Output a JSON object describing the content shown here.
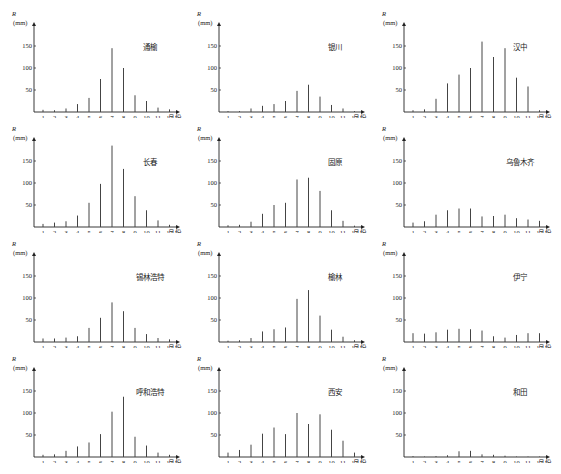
{
  "figure": {
    "y_symbol": "R",
    "y_unit": "(mm)",
    "x_unit": "月份"
  },
  "chart_data": [
    {
      "type": "bar",
      "title": "通榆",
      "xlabel": "月份",
      "ylabel": "R (mm)",
      "ylim": [
        0,
        180
      ],
      "yticks": [
        50,
        100,
        150
      ],
      "categories": [
        "1",
        "2",
        "3",
        "4",
        "5",
        "6",
        "7",
        "8",
        "9",
        "10",
        "11",
        "12"
      ],
      "values": [
        5,
        4,
        8,
        18,
        32,
        75,
        145,
        100,
        38,
        25,
        10,
        6
      ]
    },
    {
      "type": "bar",
      "title": "银川",
      "xlabel": "月份",
      "ylabel": "R (mm)",
      "ylim": [
        0,
        180
      ],
      "yticks": [
        50,
        100,
        150
      ],
      "categories": [
        "1",
        "2",
        "3",
        "4",
        "5",
        "6",
        "7",
        "8",
        "9",
        "10",
        "11",
        "12"
      ],
      "values": [
        2,
        2,
        8,
        14,
        18,
        25,
        48,
        62,
        35,
        16,
        8,
        2
      ]
    },
    {
      "type": "bar",
      "title": "汉中",
      "xlabel": "月份",
      "ylabel": "R (mm)",
      "ylim": [
        0,
        180
      ],
      "yticks": [
        50,
        100,
        150
      ],
      "categories": [
        "1",
        "2",
        "3",
        "4",
        "5",
        "6",
        "7",
        "8",
        "9",
        "10",
        "11",
        "12"
      ],
      "values": [
        4,
        6,
        30,
        65,
        85,
        100,
        160,
        125,
        145,
        78,
        58,
        4
      ]
    },
    {
      "type": "bar",
      "title": "长春",
      "xlabel": "月份",
      "ylabel": "R (mm)",
      "ylim": [
        0,
        180
      ],
      "yticks": [
        50,
        100,
        150
      ],
      "categories": [
        "1",
        "2",
        "3",
        "4",
        "5",
        "6",
        "7",
        "8",
        "9",
        "10",
        "11",
        "12"
      ],
      "values": [
        7,
        10,
        13,
        26,
        55,
        98,
        185,
        132,
        70,
        38,
        15,
        5
      ]
    },
    {
      "type": "bar",
      "title": "固原",
      "xlabel": "月份",
      "ylabel": "R (mm)",
      "ylim": [
        0,
        180
      ],
      "yticks": [
        50,
        100,
        150
      ],
      "categories": [
        "1",
        "2",
        "3",
        "4",
        "5",
        "6",
        "7",
        "8",
        "9",
        "10",
        "11",
        "12"
      ],
      "values": [
        4,
        5,
        12,
        30,
        50,
        55,
        108,
        112,
        82,
        38,
        14,
        3
      ]
    },
    {
      "type": "bar",
      "title": "乌鲁木齐",
      "xlabel": "月份",
      "ylabel": "R (mm)",
      "ylim": [
        0,
        180
      ],
      "yticks": [
        50,
        100,
        150
      ],
      "categories": [
        "1",
        "2",
        "3",
        "4",
        "5",
        "6",
        "7",
        "8",
        "9",
        "10",
        "11",
        "12"
      ],
      "values": [
        10,
        13,
        28,
        38,
        42,
        42,
        24,
        25,
        28,
        20,
        17,
        14
      ]
    },
    {
      "type": "bar",
      "title": "锡林浩特",
      "xlabel": "月份",
      "ylabel": "R (mm)",
      "ylim": [
        0,
        180
      ],
      "yticks": [
        50,
        100,
        150
      ],
      "categories": [
        "1",
        "2",
        "3",
        "4",
        "5",
        "6",
        "7",
        "8",
        "9",
        "10",
        "11",
        "12"
      ],
      "values": [
        8,
        8,
        10,
        13,
        32,
        55,
        90,
        70,
        32,
        18,
        9,
        6
      ]
    },
    {
      "type": "bar",
      "title": "榆林",
      "xlabel": "月份",
      "ylabel": "R (mm)",
      "ylim": [
        0,
        180
      ],
      "yticks": [
        50,
        100,
        150
      ],
      "categories": [
        "1",
        "2",
        "3",
        "4",
        "5",
        "6",
        "7",
        "8",
        "9",
        "10",
        "11",
        "12"
      ],
      "values": [
        3,
        4,
        9,
        24,
        29,
        33,
        98,
        118,
        60,
        28,
        12,
        4
      ]
    },
    {
      "type": "bar",
      "title": "伊宁",
      "xlabel": "月份",
      "ylabel": "R (mm)",
      "ylim": [
        0,
        180
      ],
      "yticks": [
        50,
        100,
        150
      ],
      "categories": [
        "1",
        "2",
        "3",
        "4",
        "5",
        "6",
        "7",
        "8",
        "9",
        "10",
        "11",
        "12"
      ],
      "values": [
        20,
        19,
        22,
        28,
        30,
        29,
        26,
        13,
        10,
        16,
        20,
        20
      ]
    },
    {
      "type": "bar",
      "title": "呼和浩特",
      "xlabel": "月份",
      "ylabel": "R (mm)",
      "ylim": [
        0,
        180
      ],
      "yticks": [
        50,
        100,
        150
      ],
      "categories": [
        "1",
        "2",
        "3",
        "4",
        "5",
        "6",
        "7",
        "8",
        "9",
        "10",
        "11",
        "12"
      ],
      "values": [
        5,
        6,
        14,
        24,
        33,
        52,
        103,
        137,
        46,
        26,
        10,
        5
      ]
    },
    {
      "type": "bar",
      "title": "西安",
      "xlabel": "月份",
      "ylabel": "R (mm)",
      "ylim": [
        0,
        180
      ],
      "yticks": [
        50,
        100,
        150
      ],
      "categories": [
        "1",
        "2",
        "3",
        "4",
        "5",
        "6",
        "7",
        "8",
        "9",
        "10",
        "11",
        "12"
      ],
      "values": [
        10,
        16,
        28,
        53,
        67,
        52,
        100,
        75,
        97,
        62,
        37,
        10
      ]
    },
    {
      "type": "bar",
      "title": "和田",
      "xlabel": "月份",
      "ylabel": "R (mm)",
      "ylim": [
        0,
        180
      ],
      "yticks": [
        50,
        100,
        150
      ],
      "categories": [
        "1",
        "2",
        "3",
        "4",
        "5",
        "6",
        "7",
        "8",
        "9",
        "10",
        "11",
        "12"
      ],
      "values": [
        2,
        1,
        2,
        4,
        13,
        14,
        6,
        5,
        3,
        1,
        1,
        1
      ]
    }
  ]
}
